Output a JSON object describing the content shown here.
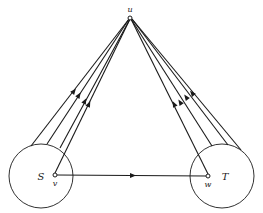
{
  "diagram": {
    "nodes": {
      "u": {
        "label": "u",
        "x": 130,
        "y": 18,
        "label_x": 130,
        "label_y": 11
      },
      "v": {
        "label": "v",
        "x": 55,
        "y": 175,
        "label_x": 55,
        "label_y": 186
      },
      "w": {
        "label": "w",
        "x": 208,
        "y": 176,
        "label_x": 208,
        "label_y": 187
      }
    },
    "sets": {
      "S": {
        "label": "S",
        "cx": 41,
        "cy": 176,
        "r": 32,
        "label_x": 40,
        "label_y": 180
      },
      "T": {
        "label": "T",
        "cx": 222,
        "cy": 176,
        "r": 32,
        "label_x": 224,
        "label_y": 177
      }
    },
    "edge_vw": {
      "from": "v",
      "to": "w",
      "arrow_x": 133,
      "direction": "right"
    },
    "stroke_color": "#1a1a1a"
  }
}
